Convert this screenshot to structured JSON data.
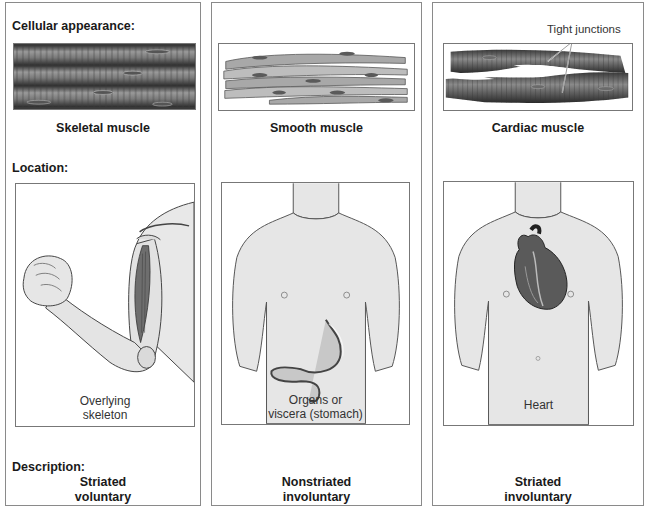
{
  "section_labels": {
    "cellular": "Cellular appearance:",
    "location": "Location:",
    "description": "Description:"
  },
  "panels": [
    {
      "id": "skeletal",
      "cell_caption": "Skeletal muscle",
      "location_caption_line1": "Overlying",
      "location_caption_line2": "skeleton",
      "illustration": "arm-with-biceps",
      "description_line1": "Striated",
      "description_line2": "voluntary"
    },
    {
      "id": "smooth",
      "cell_caption": "Smooth muscle",
      "location_caption_line1": "Organs or",
      "location_caption_line2": "viscera (stomach)",
      "illustration": "torso-with-stomach",
      "description_line1": "Nonstriated",
      "description_line2": "involuntary"
    },
    {
      "id": "cardiac",
      "cell_caption": "Cardiac muscle",
      "annotation": "Tight junctions",
      "location_caption_line1": "Heart",
      "location_caption_line2": "",
      "illustration": "torso-with-heart",
      "description_line1": "Striated",
      "description_line2": "involuntary"
    }
  ],
  "colors": {
    "border": "#8a8a8a",
    "muscle_dark": "#4a4a4a",
    "muscle_mid": "#8c8c8c",
    "skin": "#e6e6e6",
    "heart": "#5a5a5a"
  }
}
